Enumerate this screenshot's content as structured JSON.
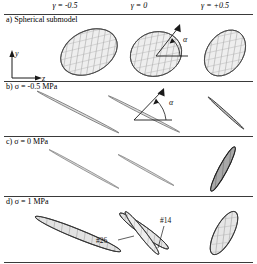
{
  "figure": {
    "columns": [
      {
        "id": "col-neg",
        "label": "γ = -0.5"
      },
      {
        "id": "col-zero",
        "label": "γ = 0"
      },
      {
        "id": "col-pos",
        "label": "γ = +0.5"
      }
    ],
    "rows": [
      {
        "id": "row-a",
        "label": "a) Spherical submodel"
      },
      {
        "id": "row-b",
        "label": "b) σ = -0.5 MPa"
      },
      {
        "id": "row-c",
        "label": "c) σ = 0 MPa"
      },
      {
        "id": "row-d",
        "label": "d) σ = 1 MPa"
      }
    ],
    "axes": {
      "vertical_label": "y",
      "horizontal_label": "z"
    },
    "angle_symbol": "α",
    "callouts": [
      {
        "id": "callout-26",
        "label": "#26"
      },
      {
        "id": "callout-14",
        "label": "#14"
      }
    ],
    "colors": {
      "line": "#3a3a3a",
      "mesh": "#7a7a7a",
      "fill": "#e8e8e8",
      "dark_fill": "#9a9a9a",
      "text": "#111111"
    }
  }
}
